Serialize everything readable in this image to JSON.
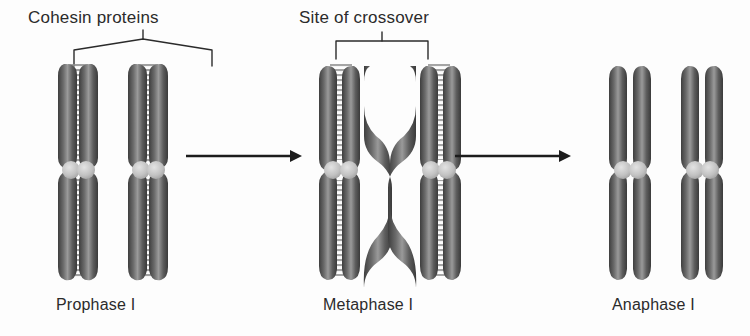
{
  "figure": {
    "background_color": "#fdfdfd",
    "ink_color": "#2b2b2b",
    "chromatid_dark": "#4a4a4a",
    "chromatid_mid": "#6e6e6e",
    "chromatid_light": "#b9b9b9",
    "centromere_color": "#c9c9c9",
    "cohesin_band_color": "#9a9a9a"
  },
  "annotations": {
    "cohesin_label": "Cohesin proteins",
    "crossover_label": "Site of crossover"
  },
  "stages": [
    {
      "id": "prophase-1",
      "label": "Prophase I",
      "description": "Two homologous chromosome pairs, sister chromatids held together by cohesin",
      "chromosome_count": 2,
      "chromatids_per_chromosome": 2,
      "cohesin_visible": true,
      "crossover_visible": false
    },
    {
      "id": "metaphase-1",
      "label": "Metaphase I",
      "description": "Homologous chromosomes paired with chiasmata at site of crossover",
      "chromosome_count": 2,
      "chromatids_per_chromosome": 2,
      "cohesin_visible": true,
      "crossover_visible": true
    },
    {
      "id": "anaphase-1",
      "label": "Anaphase I",
      "description": "Homologous chromosomes separated, cohesin released along arms",
      "chromosome_count": 2,
      "chromatids_per_chromosome": 2,
      "cohesin_visible": false,
      "crossover_visible": false
    }
  ],
  "arrows": [
    {
      "id": "arrow-prophase-to-metaphase",
      "direction": "right"
    },
    {
      "id": "arrow-metaphase-to-anaphase",
      "direction": "right"
    }
  ]
}
